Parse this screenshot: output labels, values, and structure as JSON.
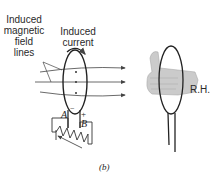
{
  "figure": {
    "label_field_lines": [
      "Induced",
      "magnetic",
      "field",
      "lines"
    ],
    "label_current": [
      "Induced",
      "current"
    ],
    "terminal_a": "A",
    "terminal_b": "B",
    "sign_minus": "−",
    "sign_plus": "+",
    "hand_label": "R.H.",
    "caption": "(b)"
  },
  "colors": {
    "line": "#333333",
    "hand_fill": "#c8c8c8",
    "hand_stroke": "#9a9a9a"
  }
}
